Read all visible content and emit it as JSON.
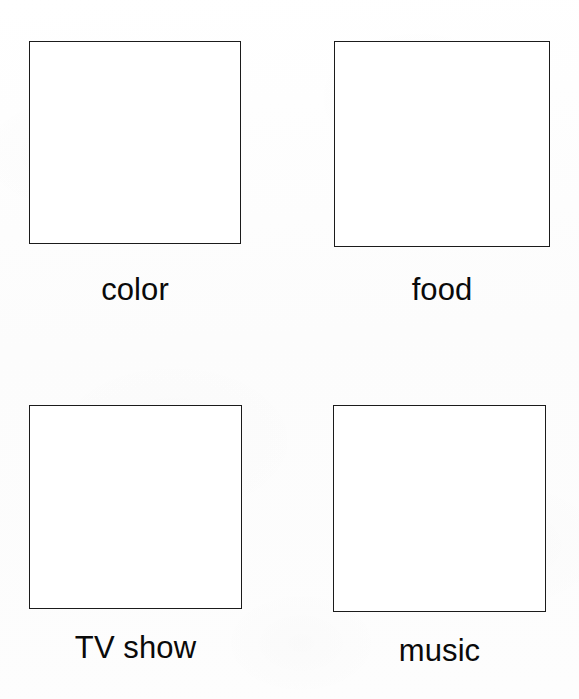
{
  "page": {
    "background_color": "#fdfdfd",
    "ink_color": "#1b1b1b",
    "border_color": "#1b1b1b",
    "layout": "2x2 grid of empty drawing boxes with captions"
  },
  "grid": {
    "rows": 2,
    "columns": 2,
    "cells": [
      {
        "id": "color",
        "label": "color",
        "box_value": "",
        "row": 1,
        "column": 1
      },
      {
        "id": "food",
        "label": "food",
        "box_value": "",
        "row": 1,
        "column": 2
      },
      {
        "id": "tv-show",
        "label": "TV show",
        "box_value": "",
        "row": 2,
        "column": 1
      },
      {
        "id": "music",
        "label": "music",
        "box_value": "",
        "row": 2,
        "column": 2
      }
    ]
  }
}
